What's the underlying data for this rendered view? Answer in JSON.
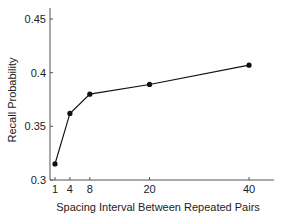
{
  "chart_data": {
    "type": "line",
    "title": "",
    "xlabel": "Spacing Interval Between Repeated Pairs",
    "ylabel": "Recall Probability",
    "x": [
      1,
      4,
      8,
      20,
      40
    ],
    "series": [
      {
        "name": "Recall",
        "values": [
          0.315,
          0.362,
          0.38,
          0.389,
          0.407
        ]
      }
    ],
    "xticks": [
      1,
      4,
      8,
      20,
      40
    ],
    "xtick_labels": [
      "1",
      "4",
      "8",
      "20",
      "40"
    ],
    "yticks": [
      0.3,
      0.35,
      0.4,
      0.45
    ],
    "ytick_labels": [
      "0.3",
      "0.35",
      "0.4",
      "0.45"
    ],
    "xlim": [
      0,
      45
    ],
    "ylim": [
      0.3,
      0.455
    ],
    "grid": false,
    "legend": null,
    "colors": {
      "line": "#111111",
      "axis": "#555555",
      "text": "#222222"
    }
  }
}
